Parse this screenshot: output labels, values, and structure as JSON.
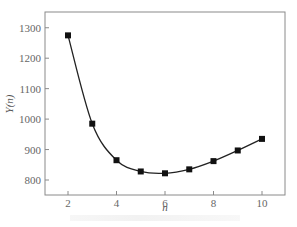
{
  "chart_data": {
    "type": "line",
    "title": "",
    "xlabel": "n",
    "ylabel": "Y(n)",
    "x": [
      2,
      3,
      4,
      5,
      6,
      7,
      8,
      9,
      10
    ],
    "series": [
      {
        "name": "Y(n)",
        "marker": "square",
        "values": [
          1275,
          985,
          865,
          828,
          822,
          835,
          862,
          897,
          935
        ]
      }
    ],
    "xlim": [
      1.1,
      10.9
    ],
    "ylim": [
      750,
      1350
    ],
    "xticks": [
      2,
      4,
      6,
      8,
      10
    ],
    "yticks": [
      800,
      900,
      1000,
      1100,
      1200,
      1300
    ],
    "grid": false,
    "legend": null
  },
  "axes": {
    "xlabel": "n",
    "ylabel": "Y(n)",
    "xtick_labels": [
      "2",
      "4",
      "6",
      "8",
      "10"
    ],
    "ytick_labels": [
      "800",
      "900",
      "1000",
      "1100",
      "1200",
      "1300"
    ]
  },
  "colors": {
    "line": "#222222",
    "marker": "#111111",
    "frame": "#888888"
  }
}
